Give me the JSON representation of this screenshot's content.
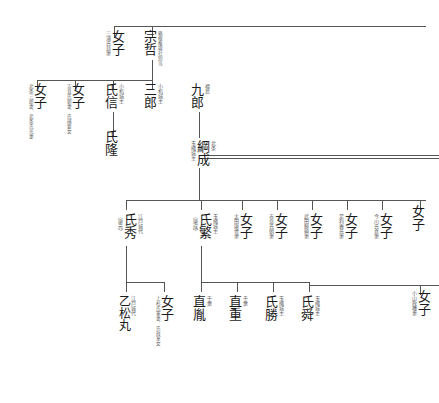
{
  "document": {
    "kind": "japanese-genealogy-chart",
    "title": "",
    "line_color": "#555555"
  },
  "people": [
    {
      "id": "p_sotetsu",
      "name": "宗哲",
      "note_right": "箱根権現社別当",
      "note_left": "",
      "x": 143,
      "y": 30
    },
    {
      "id": "p_joshi_1",
      "name": "女子",
      "note_right": "",
      "note_left": "三浦氏員妻",
      "x": 105,
      "y": 30
    },
    {
      "id": "p_saburo",
      "name": "三郎",
      "note_right": "小机城主",
      "note_left": "",
      "x": 143,
      "y": 83
    },
    {
      "id": "p_ujinobu",
      "name": "氏信",
      "note_right": "小机城主",
      "note_left": "",
      "x": 104,
      "y": 83
    },
    {
      "id": "p_joshi_2",
      "name": "女子",
      "note_right": "",
      "note_left": "吉良氏朝妻、氏捕要女",
      "x": 66,
      "y": 83
    },
    {
      "id": "p_joshi_3",
      "name": "女子",
      "note_right": "",
      "note_left": "北条三郎妻、北条氏光妻",
      "x": 28,
      "y": 83
    },
    {
      "id": "p_ujitaka",
      "name": "氏隆",
      "note_right": "",
      "note_left": "",
      "x": 104,
      "y": 130
    },
    {
      "id": "p_kuro",
      "name": "九郎",
      "note_right": "福島",
      "note_left": "",
      "x": 190,
      "y": 83
    },
    {
      "id": "p_tsunashige",
      "name": "綱成",
      "note_right": "北条",
      "note_left": "玉縄城主",
      "x": 190,
      "y": 140
    },
    {
      "id": "p_ujihide",
      "name": "氏秀",
      "note_right": "江戸城代",
      "note_left": "（康元）",
      "x": 117,
      "y": 213
    },
    {
      "id": "p_ujishige",
      "name": "氏繁",
      "note_right": "玉縄城主",
      "note_left": "（康成）",
      "x": 192,
      "y": 213
    },
    {
      "id": "p_joshi_4",
      "name": "女子",
      "note_right": "",
      "note_left": "太田康資妻",
      "x": 233,
      "y": 213
    },
    {
      "id": "p_joshi_5",
      "name": "女子",
      "note_right": "",
      "note_left": "吉良氏朝妻",
      "x": 268,
      "y": 213
    },
    {
      "id": "p_joshi_6",
      "name": "女子",
      "note_right": "",
      "note_left": "武田勝頼妻",
      "x": 303,
      "y": 213
    },
    {
      "id": "p_joshi_7",
      "name": "女子",
      "note_right": "",
      "note_left": "足利義氏妻",
      "x": 338,
      "y": 213
    },
    {
      "id": "p_joshi_8",
      "name": "女子",
      "note_right": "",
      "note_left": "今川氏真妻",
      "x": 373,
      "y": 213
    },
    {
      "id": "p_joshi_9",
      "name": "女子",
      "note_right": "",
      "note_left": "",
      "x": 411,
      "y": 205
    },
    {
      "id": "p_otomatsu",
      "name": "乙松丸",
      "note_right": "江戸城代",
      "note_left": "",
      "x": 117,
      "y": 295
    },
    {
      "id": "p_joshi_10",
      "name": "女子",
      "note_right": "",
      "note_left": "上杉氏憲妻、氏政室女",
      "x": 155,
      "y": 295
    },
    {
      "id": "p_naotane",
      "name": "直胤",
      "note_right": "千葉",
      "note_left": "",
      "x": 192,
      "y": 295
    },
    {
      "id": "p_naoshige",
      "name": "直重",
      "note_right": "千葉",
      "note_left": "",
      "x": 228,
      "y": 295
    },
    {
      "id": "p_ujikatsu",
      "name": "氏勝",
      "note_right": "玉縄城主",
      "note_left": "",
      "x": 264,
      "y": 295
    },
    {
      "id": "p_ujishun",
      "name": "氏舜",
      "note_right": "玉縄城主",
      "note_left": "",
      "x": 300,
      "y": 295
    },
    {
      "id": "p_joshi_11",
      "name": "女子",
      "note_right": "",
      "note_left": "小山政種妻",
      "x": 411,
      "y": 290
    }
  ],
  "lines": [
    {
      "name": "sibling-bar-gen1",
      "x": 114,
      "y": 26,
      "w": 312,
      "h": 1,
      "o": "h"
    },
    {
      "name": "drop-sotetsu",
      "x": 152,
      "y": 26,
      "w": 1,
      "h": 12,
      "o": "v"
    },
    {
      "name": "drop-joshi1",
      "x": 114,
      "y": 26,
      "w": 1,
      "h": 12,
      "o": "v"
    },
    {
      "name": "stem-sotetsu-down",
      "x": 152,
      "y": 60,
      "w": 1,
      "h": 22,
      "o": "v"
    },
    {
      "name": "sibling-bar-gen2",
      "x": 37,
      "y": 80,
      "w": 116,
      "h": 1,
      "o": "h"
    },
    {
      "name": "drop-saburo",
      "x": 152,
      "y": 80,
      "w": 1,
      "h": 9,
      "o": "v"
    },
    {
      "name": "drop-ujinobu",
      "x": 113,
      "y": 80,
      "w": 1,
      "h": 9,
      "o": "v"
    },
    {
      "name": "drop-joshi2",
      "x": 75,
      "y": 80,
      "w": 1,
      "h": 9,
      "o": "v"
    },
    {
      "name": "drop-joshi3",
      "x": 37,
      "y": 80,
      "w": 1,
      "h": 9,
      "o": "v"
    },
    {
      "name": "stem-ujinobu-ujitaka",
      "x": 113,
      "y": 112,
      "w": 1,
      "h": 24,
      "o": "v"
    },
    {
      "name": "stem-kuro-down",
      "x": 199,
      "y": 112,
      "w": 1,
      "h": 26,
      "o": "v"
    },
    {
      "name": "bar-tsunashige-right",
      "x": 199,
      "y": 155,
      "w": 240,
      "h": 1,
      "o": "h"
    },
    {
      "name": "bar-tsunashige-right2",
      "x": 199,
      "y": 158,
      "w": 240,
      "h": 1,
      "o": "h"
    },
    {
      "name": "stem-tsunashige-down",
      "x": 199,
      "y": 168,
      "w": 1,
      "h": 32,
      "o": "v"
    },
    {
      "name": "sibling-bar-gen3",
      "x": 126,
      "y": 200,
      "w": 300,
      "h": 1,
      "o": "h"
    },
    {
      "name": "drop-ujihide",
      "x": 126,
      "y": 200,
      "w": 1,
      "h": 10,
      "o": "v"
    },
    {
      "name": "drop-ujishige",
      "x": 201,
      "y": 200,
      "w": 1,
      "h": 10,
      "o": "v"
    },
    {
      "name": "drop-j4",
      "x": 242,
      "y": 200,
      "w": 1,
      "h": 10,
      "o": "v"
    },
    {
      "name": "drop-j5",
      "x": 277,
      "y": 200,
      "w": 1,
      "h": 10,
      "o": "v"
    },
    {
      "name": "drop-j6",
      "x": 312,
      "y": 200,
      "w": 1,
      "h": 10,
      "o": "v"
    },
    {
      "name": "drop-j7",
      "x": 347,
      "y": 200,
      "w": 1,
      "h": 10,
      "o": "v"
    },
    {
      "name": "drop-j8",
      "x": 382,
      "y": 200,
      "w": 1,
      "h": 10,
      "o": "v"
    },
    {
      "name": "drop-j9",
      "x": 420,
      "y": 200,
      "w": 1,
      "h": 10,
      "o": "v"
    },
    {
      "name": "stem-ujihide-down",
      "x": 126,
      "y": 246,
      "w": 1,
      "h": 46,
      "o": "v"
    },
    {
      "name": "stem-ujishige-down",
      "x": 201,
      "y": 246,
      "w": 1,
      "h": 36,
      "o": "v"
    },
    {
      "name": "sibling-bar-gen4",
      "x": 201,
      "y": 282,
      "w": 108,
      "h": 1,
      "o": "h"
    },
    {
      "name": "drop-naotane",
      "x": 201,
      "y": 282,
      "w": 1,
      "h": 10,
      "o": "v"
    },
    {
      "name": "drop-naoshige",
      "x": 237,
      "y": 282,
      "w": 1,
      "h": 10,
      "o": "v"
    },
    {
      "name": "drop-ujikatsu",
      "x": 273,
      "y": 282,
      "w": 1,
      "h": 10,
      "o": "v"
    },
    {
      "name": "drop-ujishun",
      "x": 309,
      "y": 282,
      "w": 1,
      "h": 10,
      "o": "v"
    },
    {
      "name": "bar-gen4-right",
      "x": 309,
      "y": 285,
      "w": 130,
      "h": 1,
      "o": "h"
    },
    {
      "name": "drop-j11",
      "x": 420,
      "y": 285,
      "w": 1,
      "h": 10,
      "o": "v"
    },
    {
      "name": "stem-otomatsu-left",
      "x": 126,
      "y": 282,
      "w": 1,
      "h": 10,
      "o": "v"
    },
    {
      "name": "bar-otomatsu-joshi",
      "x": 126,
      "y": 282,
      "w": 38,
      "h": 1,
      "o": "h"
    },
    {
      "name": "drop-joshi10",
      "x": 164,
      "y": 282,
      "w": 1,
      "h": 10,
      "o": "v"
    }
  ]
}
